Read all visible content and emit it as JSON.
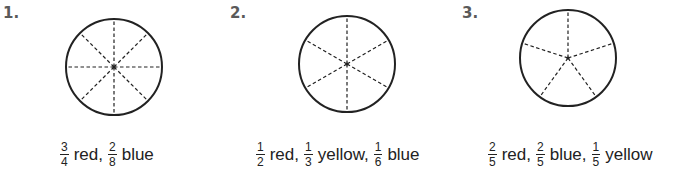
{
  "problems": [
    {
      "number": "1.",
      "parts": 8,
      "spoke_start_angle_deg": 0,
      "terms": [
        {
          "num": "3",
          "den": "4",
          "color_word": "red,"
        },
        {
          "num": "2",
          "den": "8",
          "color_word": "blue"
        }
      ]
    },
    {
      "number": "2.",
      "parts": 6,
      "spoke_start_angle_deg": 0,
      "terms": [
        {
          "num": "1",
          "den": "2",
          "color_word": "red,"
        },
        {
          "num": "1",
          "den": "3",
          "color_word": "yellow,"
        },
        {
          "num": "1",
          "den": "6",
          "color_word": "blue"
        }
      ]
    },
    {
      "number": "3.",
      "parts": 5,
      "spoke_start_angle_deg": 0,
      "terms": [
        {
          "num": "2",
          "den": "5",
          "color_word": "red,"
        },
        {
          "num": "2",
          "den": "5",
          "color_word": "blue,"
        },
        {
          "num": "1",
          "den": "5",
          "color_word": "yellow"
        }
      ]
    }
  ],
  "colors": {
    "ink": "#222222",
    "label": "#5a5a5a"
  }
}
